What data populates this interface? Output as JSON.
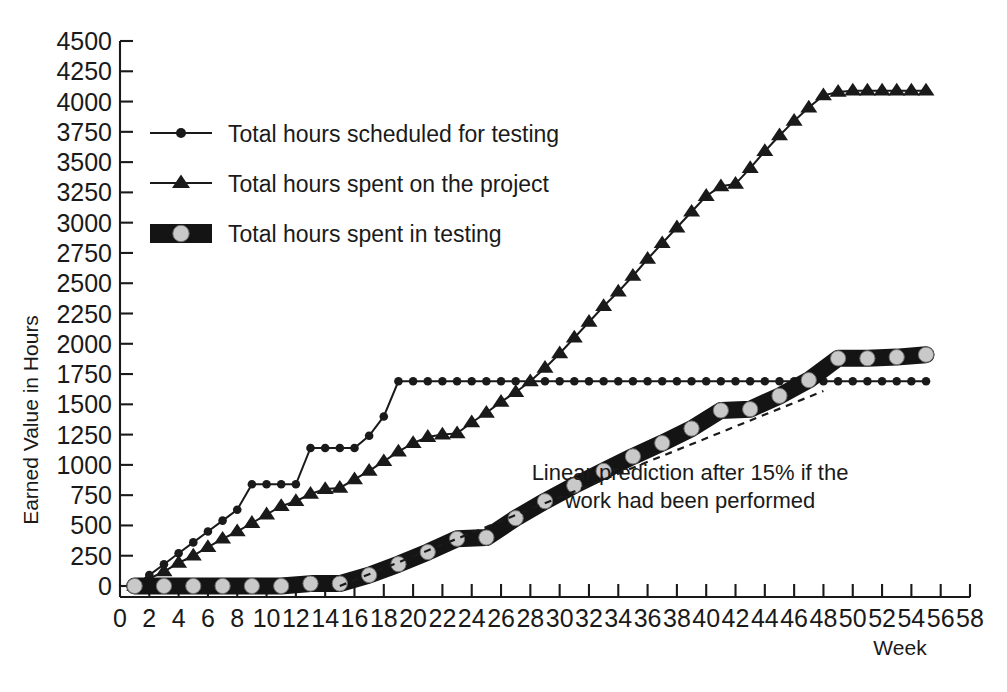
{
  "chart_data": {
    "type": "line",
    "title": "",
    "xlabel": "Week",
    "ylabel": "Earned Value in Hours",
    "xlim": [
      0,
      58
    ],
    "ylim": [
      0,
      4500
    ],
    "xticks": [
      0,
      2,
      4,
      6,
      8,
      10,
      12,
      14,
      16,
      18,
      20,
      22,
      24,
      26,
      28,
      30,
      32,
      34,
      36,
      38,
      40,
      42,
      44,
      46,
      48,
      50,
      52,
      54,
      56,
      58
    ],
    "yticks": [
      0,
      250,
      500,
      750,
      1000,
      1250,
      1500,
      1750,
      2000,
      2250,
      2500,
      2750,
      3000,
      3250,
      3500,
      3750,
      4000,
      4250,
      4500
    ],
    "grid": false,
    "legend_position": "upper-left",
    "annotations": [
      {
        "text_line1": "Linear prediction after 15% if the",
        "text_line2": "work had been performed",
        "x": 38,
        "y": 900
      }
    ],
    "series": [
      {
        "name": "Total hours scheduled for testing",
        "marker": "circle",
        "style": "line-with-dot-markers",
        "x": [
          1,
          2,
          3,
          4,
          5,
          6,
          7,
          8,
          9,
          10,
          11,
          12,
          13,
          14,
          15,
          16,
          17,
          18,
          19,
          20,
          21,
          22,
          23,
          24,
          25,
          26,
          27,
          28,
          29,
          30,
          31,
          32,
          33,
          34,
          35,
          36,
          37,
          38,
          39,
          40,
          41,
          42,
          43,
          44,
          45,
          46,
          47,
          48,
          49,
          50,
          51,
          52,
          53,
          54,
          55
        ],
        "values": [
          0,
          90,
          180,
          270,
          360,
          450,
          540,
          630,
          840,
          840,
          840,
          840,
          1140,
          1140,
          1140,
          1140,
          1240,
          1400,
          1690,
          1690,
          1690,
          1690,
          1690,
          1690,
          1690,
          1690,
          1690,
          1690,
          1690,
          1690,
          1690,
          1690,
          1690,
          1690,
          1690,
          1690,
          1690,
          1690,
          1690,
          1690,
          1690,
          1690,
          1690,
          1690,
          1690,
          1690,
          1690,
          1690,
          1690,
          1690,
          1690,
          1690,
          1690,
          1690,
          1690
        ]
      },
      {
        "name": "Total hours spent on the project",
        "marker": "triangle",
        "style": "line-with-triangle-markers",
        "x": [
          1,
          2,
          3,
          4,
          5,
          6,
          7,
          8,
          9,
          10,
          11,
          12,
          13,
          14,
          15,
          16,
          17,
          18,
          19,
          20,
          21,
          22,
          23,
          24,
          25,
          26,
          27,
          28,
          29,
          30,
          31,
          32,
          33,
          34,
          35,
          36,
          37,
          38,
          39,
          40,
          41,
          42,
          43,
          44,
          45,
          46,
          47,
          48,
          49,
          50,
          51,
          52,
          53,
          54,
          55
        ],
        "values": [
          0,
          60,
          120,
          190,
          250,
          320,
          390,
          450,
          520,
          590,
          660,
          700,
          760,
          800,
          810,
          880,
          950,
          1030,
          1110,
          1180,
          1230,
          1250,
          1260,
          1350,
          1430,
          1520,
          1600,
          1690,
          1800,
          1920,
          2050,
          2180,
          2310,
          2430,
          2560,
          2700,
          2830,
          2960,
          3090,
          3220,
          3300,
          3320,
          3450,
          3590,
          3720,
          3840,
          3950,
          4050,
          4080,
          4090,
          4090,
          4090,
          4090,
          4090,
          4090
        ]
      },
      {
        "name": "Total hours spent in testing",
        "marker": "band-circle",
        "style": "thick-band-with-grey-circles",
        "x": [
          1,
          3,
          5,
          7,
          9,
          11,
          13,
          15,
          17,
          19,
          21,
          23,
          25,
          27,
          29,
          31,
          33,
          35,
          37,
          39,
          41,
          43,
          45,
          47,
          49,
          51,
          53,
          55
        ],
        "values": [
          0,
          0,
          0,
          0,
          0,
          0,
          20,
          20,
          90,
          180,
          280,
          390,
          400,
          560,
          700,
          830,
          950,
          1070,
          1180,
          1300,
          1450,
          1460,
          1570,
          1700,
          1880,
          1880,
          1890,
          1910
        ]
      },
      {
        "name": "Linear prediction after 15% if the work had been performed",
        "marker": "none",
        "style": "dashed",
        "x": [
          15,
          48
        ],
        "values": [
          0,
          1610
        ]
      }
    ]
  },
  "axes": {
    "y_title": "Earned Value in Hours",
    "x_title": "Week"
  },
  "legend": {
    "items": [
      {
        "label": "Total hours scheduled for testing",
        "marker": "circle-line-marker"
      },
      {
        "label": "Total hours spent on the project",
        "marker": "triangle-line-marker"
      },
      {
        "label": "Total hours spent in testing",
        "marker": "band-swatch-marker"
      }
    ]
  },
  "colors": {
    "ink": "#1a1a1a",
    "band_fill": "#141414",
    "band_dot": "#c9c9c9",
    "background": "#ffffff"
  }
}
